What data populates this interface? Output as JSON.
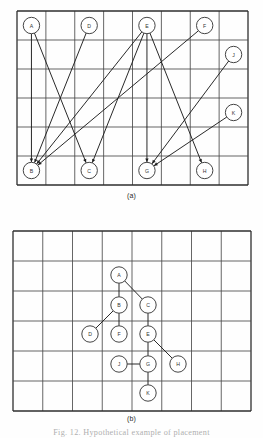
{
  "figure": {
    "caption": "Fig. 12.   Hypothetical example of placement",
    "panel_a_label": "(a)",
    "panel_b_label": "(b)",
    "colors": {
      "grid_line": "#4a4a4a",
      "grid_border": "#2e2e2e",
      "node_stroke": "#3a3a3a",
      "node_fill": "#ffffff",
      "edge": "#1e1e1e",
      "label_text": "#333333",
      "caption_text": "#6d6d6d"
    }
  },
  "panel_a": {
    "name": "initial-placement-grid",
    "grid": {
      "cols": 8,
      "rows": 6,
      "x": 17,
      "y": 11,
      "w": 231,
      "h": 174
    },
    "nodes": [
      {
        "id": "A",
        "col": 0,
        "row": 0
      },
      {
        "id": "D",
        "col": 2,
        "row": 0
      },
      {
        "id": "E",
        "col": 4,
        "row": 0
      },
      {
        "id": "F",
        "col": 6,
        "row": 0
      },
      {
        "id": "J",
        "col": 7,
        "row": 1
      },
      {
        "id": "K",
        "col": 7,
        "row": 3
      },
      {
        "id": "B",
        "col": 0,
        "row": 5
      },
      {
        "id": "C",
        "col": 2,
        "row": 5
      },
      {
        "id": "G",
        "col": 4,
        "row": 5
      },
      {
        "id": "H",
        "col": 6,
        "row": 5
      }
    ],
    "edges": [
      {
        "from": "A",
        "to": "B"
      },
      {
        "from": "A",
        "to": "C"
      },
      {
        "from": "D",
        "to": "B"
      },
      {
        "from": "E",
        "to": "B"
      },
      {
        "from": "E",
        "to": "C"
      },
      {
        "from": "E",
        "to": "G"
      },
      {
        "from": "E",
        "to": "H"
      },
      {
        "from": "F",
        "to": "B"
      },
      {
        "from": "J",
        "to": "G"
      },
      {
        "from": "K",
        "to": "G"
      }
    ]
  },
  "panel_b": {
    "name": "optimized-placement-grid",
    "grid": {
      "cols": 8,
      "rows": 6,
      "x": 13,
      "y": 231,
      "w": 238,
      "h": 180
    },
    "nodes": [
      {
        "id": "A",
        "cx": 119,
        "cy": 275
      },
      {
        "id": "B",
        "cx": 119,
        "cy": 305
      },
      {
        "id": "C",
        "cx": 148,
        "cy": 305
      },
      {
        "id": "D",
        "cx": 90,
        "cy": 334
      },
      {
        "id": "F",
        "cx": 119,
        "cy": 334
      },
      {
        "id": "E",
        "cx": 148,
        "cy": 334
      },
      {
        "id": "J",
        "cx": 119,
        "cy": 364
      },
      {
        "id": "G",
        "cx": 148,
        "cy": 364
      },
      {
        "id": "H",
        "cx": 178,
        "cy": 364
      },
      {
        "id": "K",
        "cx": 148,
        "cy": 393
      }
    ],
    "edges": [
      {
        "from": "A",
        "to": "B"
      },
      {
        "from": "A",
        "to": "C"
      },
      {
        "from": "B",
        "to": "D"
      },
      {
        "from": "B",
        "to": "F"
      },
      {
        "from": "C",
        "to": "E"
      },
      {
        "from": "E",
        "to": "G"
      },
      {
        "from": "E",
        "to": "H"
      },
      {
        "from": "J",
        "to": "G"
      },
      {
        "from": "G",
        "to": "K"
      }
    ]
  }
}
